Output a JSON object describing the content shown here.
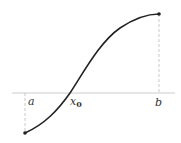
{
  "diagram": {
    "type": "function-curve-crossing-axis",
    "labels": {
      "a": "a",
      "x0_main": "x",
      "x0_sub": "0",
      "b": "b"
    },
    "colors": {
      "curve": "#222222",
      "axis": "#cccccc",
      "guide": "#bbbbbb",
      "text": "#333333"
    }
  }
}
